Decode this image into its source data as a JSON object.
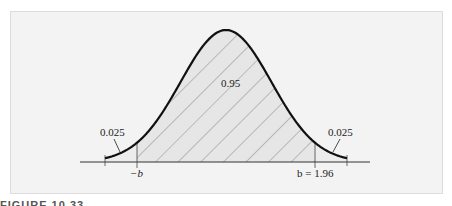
{
  "chart_data": {
    "type": "area",
    "title": "",
    "regions": [
      {
        "name": "left tail",
        "label": "0.025",
        "from": "-inf",
        "to": -1.96
      },
      {
        "name": "center",
        "label": "0.95",
        "from": -1.96,
        "to": 1.96,
        "hatched": true
      },
      {
        "name": "right tail",
        "label": "0.025",
        "from": 1.96,
        "to": "inf"
      }
    ],
    "x_tick_labels": [
      "−b",
      "b = 1.96"
    ],
    "xlabel": "",
    "ylabel": "",
    "grid": false
  },
  "labels": {
    "center_area": "0.95",
    "left_tail": "0.025",
    "right_tail": "0.025",
    "neg_b": "−b",
    "pos_b": "b = 1.96"
  },
  "caption": "FIGURE 10.33",
  "colors": {
    "background": "#f3f3f3",
    "curve": "#111111",
    "hatch": "#8a8a8a",
    "shade": "#e4e4e4"
  }
}
